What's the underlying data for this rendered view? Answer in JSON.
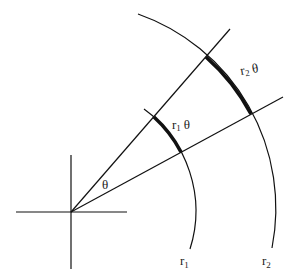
{
  "diagram": {
    "title": "",
    "colors": {
      "stroke": "#111111",
      "text": "#222222",
      "background": "#ffffff"
    },
    "origin": {
      "x": 71,
      "y": 212
    },
    "axes": {
      "horizontal": {
        "x1": 16,
        "y1": 212,
        "x2": 127,
        "y2": 212
      },
      "vertical": {
        "x1": 71,
        "y1": 155,
        "x2": 71,
        "y2": 269
      }
    },
    "rays": [
      {
        "name": "upper-ray",
        "x2": 230,
        "y2": 29
      },
      {
        "name": "lower-ray",
        "x2": 283,
        "y2": 97
      }
    ],
    "arcs": [
      {
        "name": "inner-arc",
        "radius": 126,
        "start": {
          "x": 144,
          "y": 109
        },
        "end": {
          "x": 190,
          "y": 249
        },
        "highlight_start": {
          "x": 154,
          "y": 117
        },
        "highlight_end": {
          "x": 181,
          "y": 152
        },
        "label": "r",
        "label_sub": "1",
        "segment_label": "r",
        "segment_label_sub": "1",
        "segment_label_theta": "θ"
      },
      {
        "name": "outer-arc",
        "radius": 206,
        "start": {
          "x": 138,
          "y": 14
        },
        "end": {
          "x": 272,
          "y": 248
        },
        "highlight_start": {
          "x": 206,
          "y": 57
        },
        "highlight_end": {
          "x": 251,
          "y": 114
        },
        "label": "r",
        "label_sub": "2",
        "segment_label": "r",
        "segment_label_sub": "2",
        "segment_label_theta": "θ"
      }
    ],
    "angle_label": "θ"
  }
}
